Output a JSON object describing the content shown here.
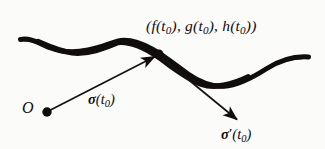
{
  "figure": {
    "name": "parametrized-curve-tangent-vector-diagram",
    "background_color": "#fbfbf9",
    "ink_color": "#100d0c"
  },
  "labels": {
    "point_coords": {
      "open_paren": "(",
      "f": "f",
      "f_arg_open": "(",
      "t": "t",
      "sub0": "0",
      "f_arg_close": ")",
      "comma1": ", ",
      "g": "g",
      "comma2": ", ",
      "h": "h",
      "close_paren": ")",
      "full_text": "(f(t0), g(t0), h(t0))"
    },
    "origin": "O",
    "position_vector": {
      "symbol": "σ",
      "arg": "t",
      "subscript": "0",
      "full_text": "σ(t0)"
    },
    "tangent_vector": {
      "symbol": "σ",
      "prime": "′",
      "arg": "t",
      "subscript": "0",
      "full_text": "σ′(t0)"
    }
  },
  "geometry": {
    "curve": {
      "type": "thick-tapered-wave",
      "stroke": "#100d0c",
      "start": [
        20,
        40
      ],
      "end": [
        309,
        57
      ],
      "valley_1": [
        49,
        48
      ],
      "crest_1": [
        117,
        41
      ],
      "valley_2": [
        224,
        86
      ]
    },
    "position_arrow": {
      "from": [
        47,
        112
      ],
      "to": [
        157,
        55
      ],
      "stroke": "#161212",
      "width": 1.6
    },
    "tangent_arrow": {
      "from": [
        163,
        59
      ],
      "to": [
        239,
        121
      ],
      "stroke": "#161212",
      "width": 1.6
    },
    "dots": [
      {
        "name": "origin-dot",
        "center": [
          47,
          112
        ],
        "r": 4.6
      },
      {
        "name": "curve-point-dot",
        "center": [
          159,
          54
        ],
        "r": 4.4
      }
    ]
  }
}
